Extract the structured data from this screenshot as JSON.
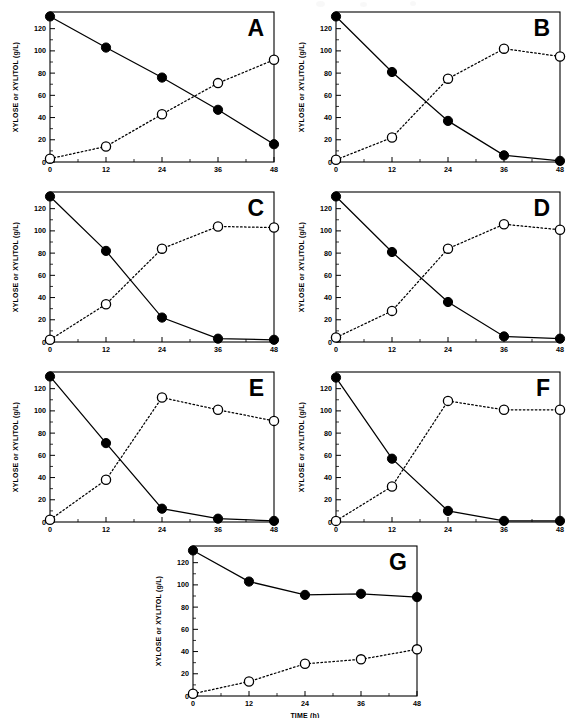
{
  "figure": {
    "axis": {
      "ylabel": "XYLOSE or XYLITOL (g/L)",
      "xlabel": "TIME (h)",
      "xticks": [
        "0",
        "12",
        "24",
        "36",
        "48"
      ],
      "yticks": [
        "0",
        "20",
        "40",
        "60",
        "80",
        "100",
        "120"
      ]
    },
    "panel_labels": [
      "A",
      "B",
      "C",
      "D",
      "E",
      "F",
      "G"
    ]
  },
  "chart_data": [
    {
      "type": "line",
      "title": "A",
      "xlabel": "TIME (h)",
      "ylabel": "XYLOSE or XYLITOL (g/L)",
      "x": [
        0,
        12,
        24,
        36,
        48
      ],
      "xlim": [
        0,
        48
      ],
      "ylim": [
        0,
        135
      ],
      "xticks": [
        0,
        12,
        24,
        36,
        48
      ],
      "yticks": [
        0,
        20,
        40,
        60,
        80,
        100,
        120
      ],
      "grid": false,
      "legend": "none",
      "series": [
        {
          "name": "XYLOSE",
          "marker": "filled-circle",
          "line": "solid",
          "values": [
            131,
            103,
            76,
            47,
            16
          ]
        },
        {
          "name": "XYLITOL",
          "marker": "open-circle",
          "line": "dotted",
          "values": [
            3,
            14,
            43,
            71,
            92
          ]
        }
      ]
    },
    {
      "type": "line",
      "title": "B",
      "xlabel": "TIME (h)",
      "ylabel": "XYLOSE or XYLITOL (g/L)",
      "x": [
        0,
        12,
        24,
        36,
        48
      ],
      "xlim": [
        0,
        48
      ],
      "ylim": [
        0,
        135
      ],
      "xticks": [
        0,
        12,
        24,
        36,
        48
      ],
      "yticks": [
        0,
        20,
        40,
        60,
        80,
        100,
        120
      ],
      "grid": false,
      "legend": "none",
      "series": [
        {
          "name": "XYLOSE",
          "marker": "filled-circle",
          "line": "solid",
          "values": [
            131,
            81,
            37,
            6,
            1
          ]
        },
        {
          "name": "XYLITOL",
          "marker": "open-circle",
          "line": "dotted",
          "values": [
            2,
            22,
            75,
            102,
            95
          ]
        }
      ]
    },
    {
      "type": "line",
      "title": "C",
      "xlabel": "TIME (h)",
      "ylabel": "XYLOSE or XYLITOL (g/L)",
      "x": [
        0,
        12,
        24,
        36,
        48
      ],
      "xlim": [
        0,
        48
      ],
      "ylim": [
        0,
        135
      ],
      "xticks": [
        0,
        12,
        24,
        36,
        48
      ],
      "yticks": [
        0,
        20,
        40,
        60,
        80,
        100,
        120
      ],
      "grid": false,
      "legend": "none",
      "series": [
        {
          "name": "XYLOSE",
          "marker": "filled-circle",
          "line": "solid",
          "values": [
            131,
            82,
            22,
            3,
            2
          ]
        },
        {
          "name": "XYLITOL",
          "marker": "open-circle",
          "line": "dotted",
          "values": [
            2,
            34,
            84,
            104,
            103
          ]
        }
      ]
    },
    {
      "type": "line",
      "title": "D",
      "xlabel": "TIME (h)",
      "ylabel": "XYLOSE or XYLITOL (g/L)",
      "x": [
        0,
        12,
        24,
        36,
        48
      ],
      "xlim": [
        0,
        48
      ],
      "ylim": [
        0,
        135
      ],
      "xticks": [
        0,
        12,
        24,
        36,
        48
      ],
      "yticks": [
        0,
        20,
        40,
        60,
        80,
        100,
        120
      ],
      "grid": false,
      "legend": "none",
      "series": [
        {
          "name": "XYLOSE",
          "marker": "filled-circle",
          "line": "solid",
          "values": [
            131,
            81,
            36,
            5,
            3
          ]
        },
        {
          "name": "XYLITOL",
          "marker": "open-circle",
          "line": "dotted",
          "values": [
            4,
            28,
            84,
            106,
            101
          ]
        }
      ]
    },
    {
      "type": "line",
      "title": "E",
      "xlabel": "TIME (h)",
      "ylabel": "XYLOSE or XYLITOL (g/L)",
      "x": [
        0,
        12,
        24,
        36,
        48
      ],
      "xlim": [
        0,
        48
      ],
      "ylim": [
        0,
        135
      ],
      "xticks": [
        0,
        12,
        24,
        36,
        48
      ],
      "yticks": [
        0,
        20,
        40,
        60,
        80,
        100,
        120
      ],
      "grid": false,
      "legend": "none",
      "series": [
        {
          "name": "XYLOSE",
          "marker": "filled-circle",
          "line": "solid",
          "values": [
            131,
            71,
            12,
            3,
            1
          ]
        },
        {
          "name": "XYLITOL",
          "marker": "open-circle",
          "line": "dotted",
          "values": [
            2,
            38,
            112,
            101,
            91
          ]
        }
      ]
    },
    {
      "type": "line",
      "title": "F",
      "xlabel": "TIME (h)",
      "ylabel": "XYLOSE or XYLITOL (g/L)",
      "x": [
        0,
        12,
        24,
        36,
        48
      ],
      "xlim": [
        0,
        48
      ],
      "ylim": [
        0,
        135
      ],
      "xticks": [
        0,
        12,
        24,
        36,
        48
      ],
      "yticks": [
        0,
        20,
        40,
        60,
        80,
        100,
        120
      ],
      "grid": false,
      "legend": "none",
      "series": [
        {
          "name": "XYLOSE",
          "marker": "filled-circle",
          "line": "solid",
          "values": [
            130,
            57,
            10,
            1,
            1
          ]
        },
        {
          "name": "XYLITOL",
          "marker": "open-circle",
          "line": "dotted",
          "values": [
            1,
            32,
            109,
            101,
            101
          ]
        }
      ]
    },
    {
      "type": "line",
      "title": "G",
      "xlabel": "TIME (h)",
      "ylabel": "XYLOSE or XYLITOL (g/L)",
      "x": [
        0,
        12,
        24,
        36,
        48
      ],
      "xlim": [
        0,
        48
      ],
      "ylim": [
        0,
        135
      ],
      "xticks": [
        0,
        12,
        24,
        36,
        48
      ],
      "yticks": [
        0,
        20,
        40,
        60,
        80,
        100,
        120
      ],
      "grid": false,
      "legend": "none",
      "series": [
        {
          "name": "XYLOSE",
          "marker": "filled-circle",
          "line": "solid",
          "values": [
            131,
            103,
            91,
            92,
            89
          ]
        },
        {
          "name": "XYLITOL",
          "marker": "open-circle",
          "line": "dotted",
          "values": [
            2,
            13,
            29,
            33,
            42
          ]
        }
      ]
    }
  ]
}
